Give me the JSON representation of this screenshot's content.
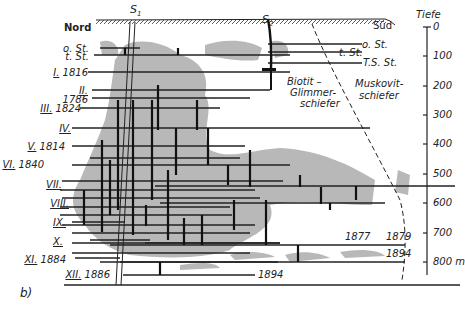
{
  "diagram": {
    "panel_label": "b)",
    "orientation": {
      "left": "Nord",
      "right": "Süd"
    },
    "shafts": [
      {
        "id": "S1",
        "label": "S",
        "sub": "1"
      },
      {
        "id": "S2",
        "label": "S",
        "sub": "2"
      }
    ],
    "depth_scale": {
      "title": "Tiefe",
      "ticks": [
        "0",
        "100",
        "200",
        "300",
        "400",
        "500",
        "600",
        "700",
        "800 m"
      ]
    },
    "level_labels_left": [
      {
        "roman": "o. St.",
        "year": ""
      },
      {
        "roman": "t. St.",
        "year": ""
      },
      {
        "roman": "I.",
        "year": "1816"
      },
      {
        "roman": "II.",
        "year": ""
      },
      {
        "roman": "",
        "year": "1786"
      },
      {
        "roman": "III.",
        "year": "1824"
      },
      {
        "roman": "IV.",
        "year": ""
      },
      {
        "roman": "V.",
        "year": "1814"
      },
      {
        "roman": "VI.",
        "year": "1840"
      },
      {
        "roman": "VII.",
        "year": ""
      },
      {
        "roman": "VIII.",
        "year": ""
      },
      {
        "roman": "IX.",
        "year": ""
      },
      {
        "roman": "X.",
        "year": ""
      },
      {
        "roman": "XI.",
        "year": "1884"
      },
      {
        "roman": "XII.",
        "year": "1886"
      }
    ],
    "level_labels_right": [
      "o. St.",
      "t. St.",
      "T.S. St."
    ],
    "rock_labels": {
      "biotit": [
        "Biotit –",
        "Glimmer-",
        "schiefer"
      ],
      "muskovit": [
        "Muskovit-",
        "schiefer"
      ]
    },
    "year_annotations": [
      "1877",
      "1879",
      "1894",
      "1894"
    ]
  }
}
